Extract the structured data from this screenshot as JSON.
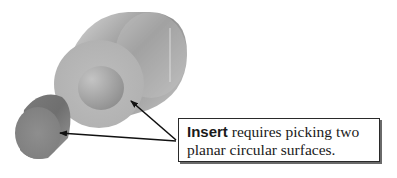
{
  "figure": {
    "callout": {
      "keyword": "Insert",
      "line1_rest": " requires picking two",
      "line2": "planar circular surfaces."
    },
    "colors": {
      "large_cylinder_face": "#b8b8b8",
      "large_cylinder_side": "#a9a9a9",
      "hole": "#a0a0a0",
      "small_cylinder_face": "#8a8a8a",
      "arrow": "#111111",
      "box_border": "#2a2a2a"
    },
    "arrows": [
      {
        "name": "arrow-to-hole-face",
        "from": [
          176,
          140
        ],
        "to": [
          129,
          99
        ]
      },
      {
        "name": "arrow-to-small-cylinder-face",
        "from": [
          176,
          141
        ],
        "to": [
          58,
          133
        ]
      }
    ]
  }
}
